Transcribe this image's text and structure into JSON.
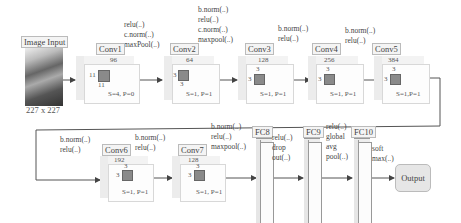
{
  "input": {
    "title": "Image Input",
    "size": "227 x 227"
  },
  "layers": [
    {
      "name": "Conv1",
      "filters": "96",
      "kernel_h": "11",
      "kernel_w": "11",
      "params": "S=4, P=0",
      "ops": "relu(..)\nc.norm(..)\nmaxPool(..)"
    },
    {
      "name": "Conv2",
      "filters": "64",
      "kernel_h": "3",
      "kernel_w": "3",
      "params": "S=1, P=1",
      "ops": "b.norm(..)\nrelu(..)\nc.norm(..)\nmaxpool(..)"
    },
    {
      "name": "Conv3",
      "filters": "128",
      "kernel_h": "3",
      "kernel_w": "3",
      "params": "S=1, P=1",
      "ops": "b.norm(..)\nrelu(..)"
    },
    {
      "name": "Conv4",
      "filters": "256",
      "kernel_h": "3",
      "kernel_w": "3",
      "params": "S=1, P=1",
      "ops": "b.norm(..)\nrelu(..)"
    },
    {
      "name": "Conv5",
      "filters": "384",
      "kernel_h": "3",
      "kernel_w": "3",
      "params": "S=1,P=1",
      "ops": "b.norm(..)\nrelu(..)"
    },
    {
      "name": "Conv6",
      "filters": "192",
      "kernel_h": "3",
      "kernel_w": "3",
      "params": "S=1, P=1",
      "ops": "b.norm(..)\nrelu(..)"
    },
    {
      "name": "Conv7",
      "filters": "128",
      "kernel_h": "3",
      "kernel_w": "3",
      "params": "S=1, P=1",
      "ops": "b.norm(..)\nrelu(..)\nmaxpool(..)"
    },
    {
      "name": "FC8",
      "ops": "relu(..)\ndrop\nout(..)"
    },
    {
      "name": "FC9",
      "ops": "relu(..)\nglobal\navg\npool(..)"
    },
    {
      "name": "FC10",
      "ops": "soft\nmax(..)"
    }
  ],
  "pre_conv1_ops": "relu(..)\nc.norm(..)\nmaxPool(..)",
  "output": {
    "label": "Output"
  }
}
